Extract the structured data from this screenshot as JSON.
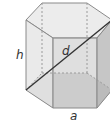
{
  "diagram": {
    "labels": {
      "height": "h",
      "diagonal": "d",
      "side": "a"
    },
    "colors": {
      "edge": "#7a7a7a",
      "face_light": "#eeeeee",
      "face_mid": "#d9d9d9",
      "face_dark": "#bdbdbd",
      "bottom": "#a9a9a9",
      "diagonal": "#333333"
    }
  }
}
